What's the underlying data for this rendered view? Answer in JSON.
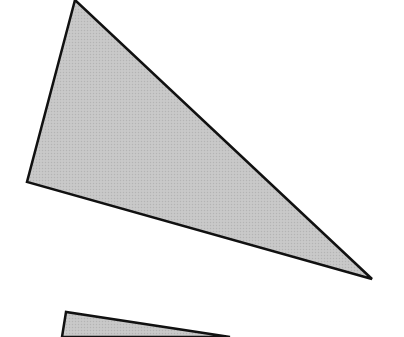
{
  "canvas": {
    "width": 404,
    "height": 337,
    "background": "#ffffff"
  },
  "shapes": [
    {
      "name": "upper-triangle",
      "type": "polygon",
      "points": "75,0 27,182 372,279",
      "fill": "#c4c4c4",
      "stroke": "#111111",
      "stroke_width": 2.5
    },
    {
      "name": "lower-partial-shape",
      "type": "polygon",
      "points": "66,312 62,337 230,337",
      "fill": "#c4c4c4",
      "stroke": "#111111",
      "stroke_width": 2.5
    }
  ],
  "colors": {
    "fill": "#c4c4c4",
    "outline": "#111111"
  }
}
